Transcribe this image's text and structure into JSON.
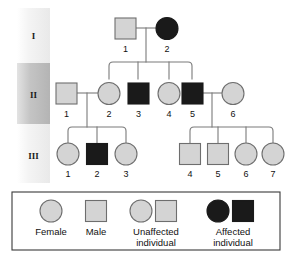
{
  "colors": {
    "unaffected_fill": "#d4d4d4",
    "affected_fill": "#1a1a1a",
    "symbol_stroke": "#6e6e6e",
    "line": "#7a7a7a",
    "legend_border": "#3a3a3a",
    "band_light": "#f2f2f2",
    "band_dark": "#bdbdbd",
    "text": "#111111",
    "background": "#ffffff"
  },
  "generations": [
    {
      "label": "I",
      "band_shade": "light"
    },
    {
      "label": "II",
      "band_shade": "dark"
    },
    {
      "label": "III",
      "band_shade": "light"
    }
  ],
  "individuals": [
    {
      "id": "I-1",
      "generation": "I",
      "number": "1",
      "sex": "male",
      "status": "unaffected",
      "cx": 125,
      "cy": 28
    },
    {
      "id": "I-2",
      "generation": "I",
      "number": "2",
      "sex": "female",
      "status": "affected",
      "cx": 167,
      "cy": 28
    },
    {
      "id": "II-1",
      "generation": "II",
      "number": "1",
      "sex": "male",
      "status": "unaffected",
      "cx": 66,
      "cy": 93
    },
    {
      "id": "II-2",
      "generation": "II",
      "number": "2",
      "sex": "female",
      "status": "unaffected",
      "cx": 109,
      "cy": 93
    },
    {
      "id": "II-3",
      "generation": "II",
      "number": "3",
      "sex": "male",
      "status": "affected",
      "cx": 138,
      "cy": 93
    },
    {
      "id": "II-4",
      "generation": "II",
      "number": "4",
      "sex": "female",
      "status": "unaffected",
      "cx": 169,
      "cy": 93
    },
    {
      "id": "II-5",
      "generation": "II",
      "number": "5",
      "sex": "male",
      "status": "affected",
      "cx": 192,
      "cy": 93
    },
    {
      "id": "II-6",
      "generation": "II",
      "number": "6",
      "sex": "female",
      "status": "unaffected",
      "cx": 233,
      "cy": 93
    },
    {
      "id": "III-1",
      "generation": "III",
      "number": "1",
      "sex": "female",
      "status": "unaffected",
      "cx": 68,
      "cy": 157
    },
    {
      "id": "III-2",
      "generation": "III",
      "number": "2",
      "sex": "male",
      "status": "affected",
      "cx": 97,
      "cy": 157
    },
    {
      "id": "III-3",
      "generation": "III",
      "number": "3",
      "sex": "female",
      "status": "unaffected",
      "cx": 126,
      "cy": 157
    },
    {
      "id": "III-4",
      "generation": "III",
      "number": "4",
      "sex": "male",
      "status": "unaffected",
      "cx": 190,
      "cy": 157
    },
    {
      "id": "III-5",
      "generation": "III",
      "number": "5",
      "sex": "male",
      "status": "unaffected",
      "cx": 218,
      "cy": 157
    },
    {
      "id": "III-6",
      "generation": "III",
      "number": "6",
      "sex": "female",
      "status": "unaffected",
      "cx": 246,
      "cy": 157
    },
    {
      "id": "III-7",
      "generation": "III",
      "number": "7",
      "sex": "female",
      "status": "unaffected",
      "cx": 273,
      "cy": 157
    }
  ],
  "matings": [
    {
      "id": "mating-I",
      "partners": [
        "I-1",
        "I-2"
      ],
      "children": [
        "II-2",
        "II-3",
        "II-4",
        "II-5"
      ]
    },
    {
      "id": "mating-II-a",
      "partners": [
        "II-1",
        "II-2"
      ],
      "children": [
        "III-1",
        "III-2",
        "III-3"
      ]
    },
    {
      "id": "mating-II-b",
      "partners": [
        "II-5",
        "II-6"
      ],
      "children": [
        "III-4",
        "III-5",
        "III-6",
        "III-7"
      ]
    }
  ],
  "legend": {
    "items": [
      {
        "key": "female",
        "label": "Female",
        "symbols": [
          "circle-unaffected"
        ]
      },
      {
        "key": "male",
        "label": "Male",
        "symbols": [
          "square-unaffected"
        ]
      },
      {
        "key": "unaffected",
        "label": "Unaffected\nindividual",
        "line1": "Unaffected",
        "line2": "individual",
        "symbols": [
          "circle-unaffected",
          "square-unaffected"
        ]
      },
      {
        "key": "affected",
        "label": "Affected\nindividual",
        "line1": "Affected",
        "line2": "individual",
        "symbols": [
          "circle-affected",
          "square-affected"
        ]
      }
    ]
  }
}
